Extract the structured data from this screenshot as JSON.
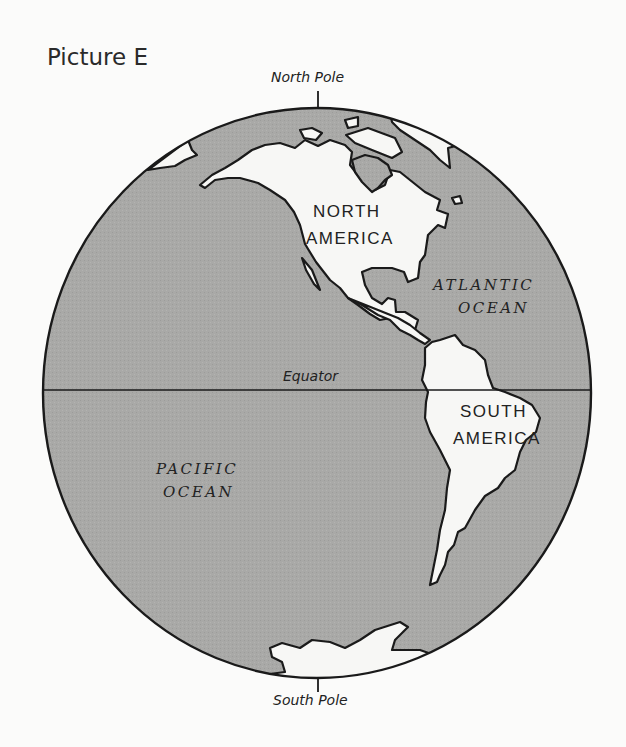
{
  "title": "Picture E",
  "globe": {
    "north_pole_label": "North Pole",
    "south_pole_label": "South Pole",
    "equator_label": "Equator",
    "continents": [
      {
        "name_line1": "NORTH",
        "name_line2": "AMERICA"
      },
      {
        "name_line1": "SOUTH",
        "name_line2": "AMERICA"
      }
    ],
    "oceans": [
      {
        "name_line1": "ATLANTIC",
        "name_line2": "OCEAN"
      },
      {
        "name_line1": "PACIFIC",
        "name_line2": "OCEAN"
      }
    ],
    "colors": {
      "ocean": "#a9a9a7",
      "land": "#f7f7f5",
      "outline": "#1a1a1a"
    }
  }
}
